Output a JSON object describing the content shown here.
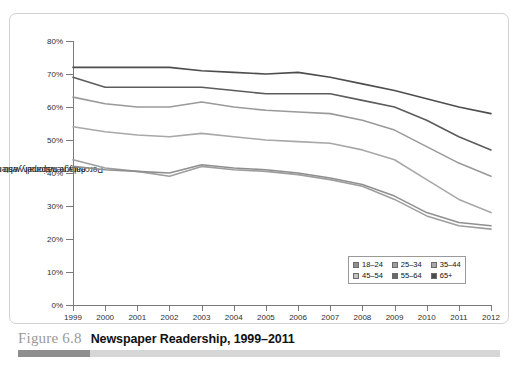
{
  "caption": {
    "figure_number": "Figure 6.8",
    "title": "Newspaper Readership, 1999–2011"
  },
  "chart_data": {
    "type": "line",
    "title": "Newspaper Readership, 1999–2011",
    "xlabel": "",
    "ylabel": "Percentage nationally who read any daily newspaper yesterday",
    "ylabel_line1": "Percentage nationally who read any",
    "ylabel_line2": "daily newspaper yesterday",
    "categories": [
      "1999",
      "2000",
      "2001",
      "2002",
      "2003",
      "2004",
      "2005",
      "2006",
      "2007",
      "2008",
      "2009",
      "2010",
      "2011",
      "2012"
    ],
    "x": [
      1999,
      2000,
      2001,
      2002,
      2003,
      2004,
      2005,
      2006,
      2007,
      2008,
      2009,
      2010,
      2011,
      2012
    ],
    "ylim": [
      0,
      80
    ],
    "yticks": [
      0,
      10,
      20,
      30,
      40,
      50,
      60,
      70,
      80
    ],
    "ytick_labels": [
      "0%",
      "10%",
      "20%",
      "30%",
      "40%",
      "50%",
      "60%",
      "70%",
      "80%"
    ],
    "grid": false,
    "legend_position": "bottom-right",
    "series": [
      {
        "name": "65+",
        "color": "#4d4d4d",
        "values": [
          72,
          72,
          72,
          72,
          71,
          70.5,
          70,
          70.5,
          69,
          67,
          65,
          62.5,
          60,
          58
        ]
      },
      {
        "name": "55–64",
        "color": "#5c5c5c",
        "values": [
          69,
          66,
          66,
          66,
          66,
          65,
          64,
          64,
          64,
          62,
          60,
          56,
          51,
          47
        ]
      },
      {
        "name": "45–54",
        "color": "#9a9a9a",
        "values": [
          63,
          61,
          60,
          60,
          61.5,
          60,
          59,
          58.5,
          58,
          56,
          53,
          48,
          43,
          39
        ]
      },
      {
        "name": "35–44",
        "color": "#a8a8a8",
        "values": [
          54,
          52.5,
          51.5,
          51,
          52,
          51,
          50,
          49.5,
          49,
          47,
          44,
          38,
          32,
          28
        ]
      },
      {
        "name": "25–34",
        "color": "#9e9e9e",
        "values": [
          44,
          41.5,
          40.5,
          39,
          42,
          41,
          40.5,
          39.5,
          38,
          36,
          32,
          27,
          24,
          23
        ]
      },
      {
        "name": "18–24",
        "color": "#8f8f8f",
        "values": [
          42,
          41,
          40.5,
          40,
          42.5,
          41.5,
          41,
          40,
          38.5,
          36.5,
          33,
          28,
          25,
          24
        ]
      }
    ],
    "legend": [
      {
        "label": "18–24",
        "swatch": "#8f8f8f"
      },
      {
        "label": "25–34",
        "swatch": "#9e9e9e"
      },
      {
        "label": "35–44",
        "swatch": "#a8a8a8"
      },
      {
        "label": "45–54",
        "swatch": "#c2c2c2"
      },
      {
        "label": "55–64",
        "swatch": "#6b6b6b"
      },
      {
        "label": "65+",
        "swatch": "#4d4d4d"
      }
    ]
  }
}
